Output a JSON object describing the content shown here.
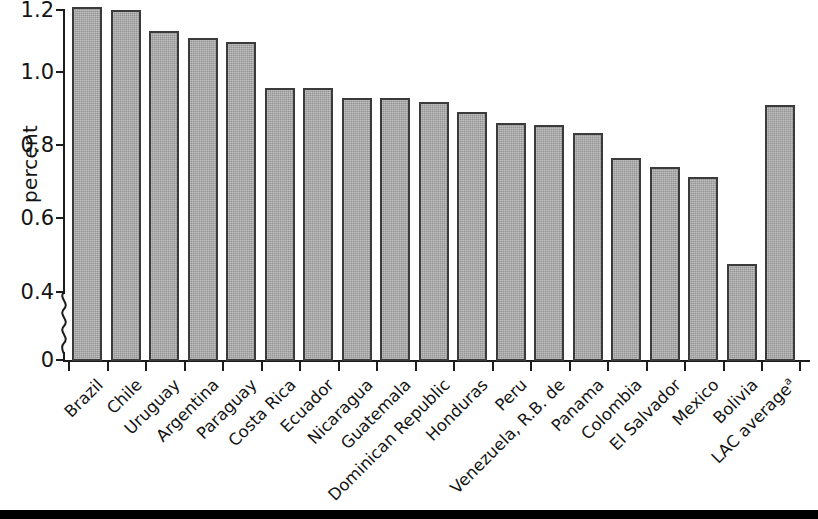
{
  "chart_data": {
    "type": "bar",
    "title": "",
    "subtitle": "",
    "xlabel": "",
    "ylabel": "percent",
    "ylim": [
      0,
      1.2
    ],
    "y_axis_break": true,
    "y_break_between": [
      0,
      0.4
    ],
    "ytick_labels": [
      "1.2",
      "1.0",
      "0.8",
      "0.6",
      "0.4",
      "0"
    ],
    "ytick_values": [
      1.2,
      1.0,
      0.8,
      0.6,
      0.4,
      0
    ],
    "grid": false,
    "legend": null,
    "bar_color": "#a7a7a7",
    "bar_border_color": "#3b3b3b",
    "categories": [
      "Brazil",
      "Chile",
      "Uruguay",
      "Argentina",
      "Paraguay",
      "Costa Rica",
      "Ecuador",
      "Nicaragua",
      "Guatemala",
      "Dominican Republic",
      "Honduras",
      "Peru",
      "Venezuela, R.B. de",
      "Panama",
      "Colombia",
      "El Salvador",
      "Mexico",
      "Bolivia",
      "LAC average"
    ],
    "category_footnotes": {
      "LAC average": "a"
    },
    "values": [
      1.21,
      1.2,
      1.14,
      1.12,
      1.11,
      0.98,
      0.98,
      0.95,
      0.95,
      0.94,
      0.91,
      0.88,
      0.875,
      0.85,
      0.78,
      0.755,
      0.725,
      0.48,
      0.93
    ]
  }
}
